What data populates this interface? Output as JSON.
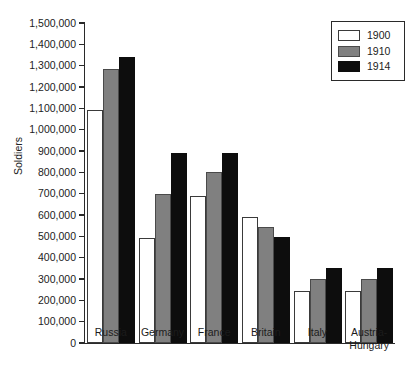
{
  "chart_data": {
    "type": "bar",
    "title": "",
    "xlabel": "",
    "ylabel": "Soldiers",
    "ylim": [
      0,
      1500000
    ],
    "ytick_step": 100000,
    "grid": false,
    "legend_position": "top-right",
    "categories": [
      "Russia",
      "Germany",
      "France",
      "Britain",
      "Italy",
      "Austria-\nHungary"
    ],
    "ytick_labels": [
      "1,500,000",
      "1,400,000",
      "1,300,000",
      "1,200,000",
      "1,100,000",
      "1,000,000",
      "900,000",
      "800,000",
      "700,000",
      "600,000",
      "500,000",
      "400,000",
      "300,000",
      "200,000",
      "100,000",
      "0"
    ],
    "series": [
      {
        "name": "1900",
        "color": "#ffffff",
        "values": [
          1090000,
          490000,
          690000,
          590000,
          245000,
          245000
        ]
      },
      {
        "name": "1910",
        "color": "#808080",
        "values": [
          1285000,
          700000,
          800000,
          545000,
          300000,
          300000
        ]
      },
      {
        "name": "1914",
        "color": "#0d0d0d",
        "values": [
          1340000,
          890000,
          890000,
          495000,
          350000,
          350000
        ]
      }
    ]
  }
}
